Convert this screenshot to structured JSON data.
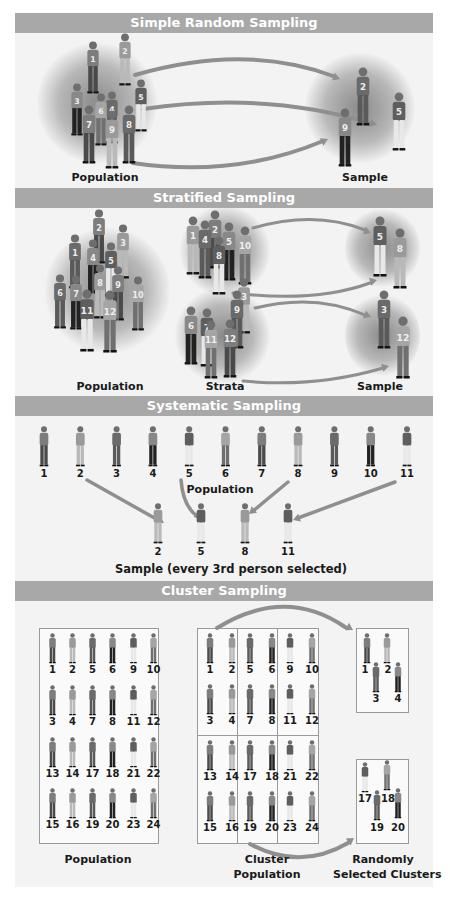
{
  "colors": {
    "header_bg": "#a8a8a8",
    "header_text": "#ffffff",
    "panel_bg": "#f3f3f3",
    "arrow": "#8f8f8f",
    "figure_dark": "#3a3a3a",
    "figure_mid": "#777777",
    "figure_light": "#bdbdbd"
  },
  "simple": {
    "title": "Simple Random Sampling",
    "population_label": "Population",
    "sample_label": "Sample",
    "population_ids": [
      "1",
      "2",
      "3",
      "4",
      "5",
      "6",
      "7",
      "8",
      "9"
    ],
    "sample_ids": [
      "2",
      "9",
      "5"
    ]
  },
  "stratified": {
    "title": "Stratified Sampling",
    "population_label": "Population",
    "strata_label": "Strata",
    "sample_label": "Sample",
    "population_ids": [
      "1",
      "2",
      "3",
      "4",
      "5",
      "6",
      "7",
      "8",
      "9",
      "10",
      "11",
      "12"
    ],
    "strata": [
      {
        "ids": [
          "1",
          "2",
          "4",
          "5",
          "8",
          "10"
        ],
        "sample": [
          "5",
          "8"
        ]
      },
      {
        "ids": [
          "3",
          "6",
          "7",
          "9",
          "11",
          "12"
        ],
        "sample": [
          "3",
          "12"
        ]
      }
    ]
  },
  "systematic": {
    "title": "Systematic Sampling",
    "population_label": "Population",
    "population_ids": [
      "1",
      "2",
      "3",
      "4",
      "5",
      "6",
      "7",
      "8",
      "9",
      "10",
      "11"
    ],
    "sample_ids": [
      "2",
      "5",
      "8",
      "11"
    ],
    "sample_label": "Sample (every 3rd person selected)"
  },
  "cluster": {
    "title": "Cluster Sampling",
    "population_label": "Population",
    "cluster_label_1": "Cluster",
    "cluster_label_2": "Population",
    "selected_label_1": "Randomly",
    "selected_label_2": "Selected Clusters",
    "grid_rows": [
      [
        "1",
        "2",
        "5",
        "6",
        "9",
        "10"
      ],
      [
        "3",
        "4",
        "7",
        "8",
        "11",
        "12"
      ],
      [
        "13",
        "14",
        "17",
        "18",
        "21",
        "22"
      ],
      [
        "15",
        "16",
        "19",
        "20",
        "23",
        "24"
      ]
    ],
    "selected_clusters": [
      {
        "top": [
          "1",
          "2"
        ],
        "bottom": [
          "3",
          "4"
        ]
      },
      {
        "top": [
          "17",
          "18"
        ],
        "bottom": [
          "19",
          "20"
        ]
      }
    ]
  }
}
